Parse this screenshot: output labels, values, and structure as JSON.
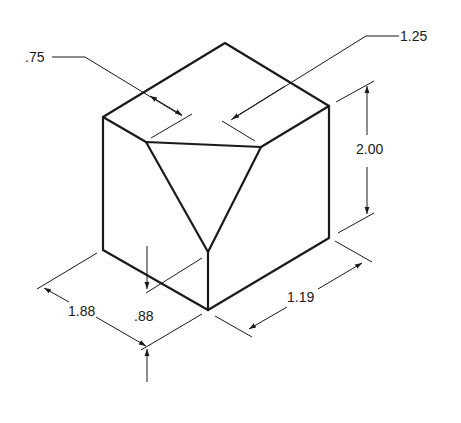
{
  "dimensions": {
    "top_left_offset": ".75",
    "top_right_offset": "1.25",
    "height": "2.00",
    "depth_left": "1.88",
    "corner_drop": ".88",
    "width_right": "1.19"
  },
  "colors": {
    "line": "#1a1a1a",
    "background": "#ffffff"
  }
}
